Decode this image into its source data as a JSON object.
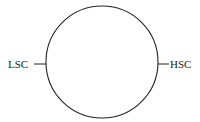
{
  "diagram": {
    "left_label": "LSC",
    "right_label": "HSC",
    "stroke_color": "#222222"
  }
}
